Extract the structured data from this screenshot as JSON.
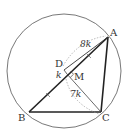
{
  "diagram": {
    "type": "geometry",
    "points": {
      "A": {
        "label": "A",
        "x": 108,
        "y": 37
      },
      "B": {
        "label": "B",
        "x": 29,
        "y": 112
      },
      "C": {
        "label": "C",
        "x": 101,
        "y": 112
      },
      "D": {
        "label": "D",
        "x": 64,
        "y": 70
      },
      "M": {
        "label": "M",
        "x": 67,
        "y": 74
      }
    },
    "circle": {
      "cx": 64,
      "cy": 71,
      "r": 57
    },
    "measurements": {
      "DA": "8k",
      "DM": "k",
      "MC": "7k"
    },
    "colors": {
      "stroke": "#222222",
      "thin": "#444444",
      "dashed": "#999999"
    }
  }
}
